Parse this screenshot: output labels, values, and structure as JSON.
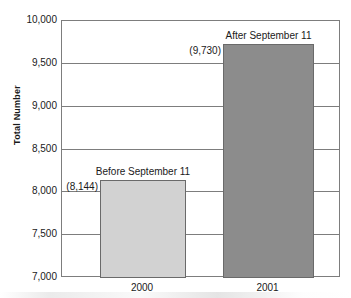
{
  "chart_data": {
    "type": "bar",
    "title": "",
    "xlabel": "",
    "ylabel": "Total Number",
    "categories": [
      "2000",
      "2001"
    ],
    "values": [
      8144,
      9730
    ],
    "value_labels": [
      "(8,144)",
      "(9,730)"
    ],
    "series_titles": [
      "Before September 11",
      "After September 11"
    ],
    "bar_colors": [
      "#d2d2d2",
      "#8c8c8c"
    ],
    "ylim": [
      7000,
      10000
    ],
    "ytick_labels": [
      "10,000",
      "9,500",
      "9,000",
      "8,500",
      "8,000",
      "7,500",
      "7,000"
    ],
    "ytick_values": [
      10000,
      9500,
      9000,
      8500,
      8000,
      7500,
      7000
    ],
    "grid": true,
    "legend": "none",
    "axis_color": "#7d7d7d"
  }
}
